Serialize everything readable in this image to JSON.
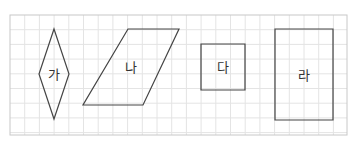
{
  "grid": {
    "x": 10,
    "y": 15,
    "width": 337,
    "height": 120,
    "spacing": 14.7,
    "line_color": "#e4e4e4",
    "border_color": "#c8c8c8"
  },
  "shapes": [
    {
      "id": "ga",
      "label": "가",
      "type": "rhombus",
      "points": "54,29 69,74 54,119 39,74",
      "label_x": 54,
      "label_y": 79
    },
    {
      "id": "na",
      "label": "나",
      "type": "parallelogram",
      "points": "128,29 179,29 143,105 83,105",
      "label_x": 131,
      "label_y": 72
    },
    {
      "id": "da",
      "label": "다",
      "type": "square",
      "points": "201,44 245,44 245,90 201,90",
      "label_x": 223,
      "label_y": 72
    },
    {
      "id": "ra",
      "label": "라",
      "type": "rectangle",
      "points": "275,29 333,29 333,120 275,120",
      "label_x": 304,
      "label_y": 80
    }
  ],
  "stroke_color": "#444444"
}
